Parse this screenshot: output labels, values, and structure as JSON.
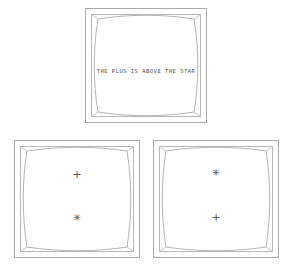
{
  "scene": {
    "background_color": "#ffffff",
    "frame_stroke_color": "#a9a9a9",
    "symbol_color": "#555555",
    "text_color": "#4a4a4a"
  },
  "panels": [
    {
      "id": "instruction-panel",
      "position": "top-center",
      "caption": "THE PLUS IS ABOVE THE STAR",
      "symbols": []
    },
    {
      "id": "option-panel-left",
      "position": "bottom-left",
      "caption": "",
      "symbols": [
        {
          "name": "plus",
          "glyph": "+",
          "order": "upper"
        },
        {
          "name": "star",
          "glyph": "✳",
          "order": "lower"
        }
      ]
    },
    {
      "id": "option-panel-right",
      "position": "bottom-right",
      "caption": "",
      "symbols": [
        {
          "name": "star",
          "glyph": "✳",
          "order": "upper"
        },
        {
          "name": "plus",
          "glyph": "+",
          "order": "lower"
        }
      ]
    }
  ]
}
